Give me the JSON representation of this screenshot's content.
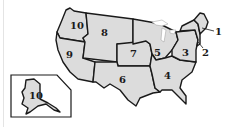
{
  "map": {
    "title": "EPA Regions",
    "fill_color": "#dcdcdc",
    "border_color": "#1a1a1a",
    "regions": [
      {
        "id": 1,
        "label": "1"
      },
      {
        "id": 2,
        "label": "2"
      },
      {
        "id": 3,
        "label": "3"
      },
      {
        "id": 4,
        "label": "4"
      },
      {
        "id": 5,
        "label": "5"
      },
      {
        "id": 6,
        "label": "6"
      },
      {
        "id": 7,
        "label": "7"
      },
      {
        "id": 8,
        "label": "8"
      },
      {
        "id": 9,
        "label": "9"
      },
      {
        "id": 10,
        "label": "10"
      }
    ],
    "inset": {
      "name": "Alaska",
      "label": "10"
    }
  }
}
